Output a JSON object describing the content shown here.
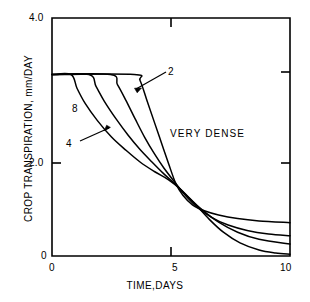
{
  "chart_data": {
    "type": "line",
    "title": "",
    "xlabel": "TIME,DAYS",
    "ylabel": "CROP TRANSPIRATION, mm/DAY",
    "xlim": [
      0,
      10
    ],
    "ylim": [
      0,
      4.0
    ],
    "xticks": [
      0,
      5,
      10
    ],
    "xticklabels": [
      "0",
      "5",
      "10"
    ],
    "yticks": [
      0,
      2.0,
      4.0
    ],
    "yticklabels": [
      "0",
      "2.0",
      "4.0"
    ],
    "grid": false,
    "legend": "none",
    "annotations": [
      {
        "text": "VERY DENSE",
        "x": 5.6,
        "y": 2.35
      },
      {
        "text": "2",
        "x": 5.35,
        "y": 3.22
      },
      {
        "text": "8",
        "x": 0.95,
        "y": 2.68
      },
      {
        "text": "4",
        "x": 0.65,
        "y": 2.05
      }
    ],
    "plateau_value": 3.05,
    "series": [
      {
        "name": "2",
        "label": "2",
        "color": "#000000",
        "points": [
          [
            0.0,
            3.05
          ],
          [
            3.45,
            3.05
          ],
          [
            3.7,
            2.95
          ],
          [
            4.0,
            2.6
          ],
          [
            4.3,
            2.25
          ],
          [
            4.6,
            1.9
          ],
          [
            4.9,
            1.55
          ],
          [
            5.2,
            1.22
          ],
          [
            5.5,
            1.02
          ],
          [
            5.9,
            0.86
          ],
          [
            6.4,
            0.76
          ],
          [
            7.0,
            0.69
          ],
          [
            7.8,
            0.63
          ],
          [
            8.7,
            0.59
          ],
          [
            10.0,
            0.56
          ]
        ]
      },
      {
        "name": "4",
        "label": "4",
        "color": "#000000",
        "points": [
          [
            0.0,
            3.05
          ],
          [
            2.45,
            3.05
          ],
          [
            2.75,
            2.88
          ],
          [
            3.1,
            2.62
          ],
          [
            3.5,
            2.3
          ],
          [
            3.9,
            1.99
          ],
          [
            4.3,
            1.72
          ],
          [
            4.7,
            1.48
          ],
          [
            5.2,
            1.22
          ],
          [
            5.6,
            1.02
          ],
          [
            6.1,
            0.82
          ],
          [
            6.7,
            0.65
          ],
          [
            7.4,
            0.52
          ],
          [
            8.2,
            0.43
          ],
          [
            9.1,
            0.37
          ],
          [
            10.0,
            0.34
          ]
        ]
      },
      {
        "name": "8",
        "label": "8",
        "color": "#000000",
        "points": [
          [
            0.0,
            3.05
          ],
          [
            1.55,
            3.05
          ],
          [
            1.85,
            2.85
          ],
          [
            2.2,
            2.6
          ],
          [
            2.7,
            2.3
          ],
          [
            3.2,
            2.03
          ],
          [
            3.7,
            1.79
          ],
          [
            4.2,
            1.58
          ],
          [
            4.7,
            1.38
          ],
          [
            5.2,
            1.2
          ],
          [
            5.7,
            1.0
          ],
          [
            6.3,
            0.78
          ],
          [
            7.0,
            0.57
          ],
          [
            7.8,
            0.4
          ],
          [
            8.7,
            0.28
          ],
          [
            10.0,
            0.2
          ]
        ]
      },
      {
        "name": "16",
        "label": "",
        "color": "#000000",
        "points": [
          [
            0.0,
            3.05
          ],
          [
            0.8,
            3.05
          ],
          [
            1.05,
            2.82
          ],
          [
            1.4,
            2.56
          ],
          [
            1.9,
            2.28
          ],
          [
            2.5,
            2.0
          ],
          [
            3.1,
            1.78
          ],
          [
            3.7,
            1.58
          ],
          [
            4.3,
            1.42
          ],
          [
            4.9,
            1.28
          ],
          [
            5.4,
            1.12
          ],
          [
            6.0,
            0.88
          ],
          [
            6.6,
            0.62
          ],
          [
            7.2,
            0.4
          ],
          [
            7.9,
            0.22
          ],
          [
            8.7,
            0.1
          ],
          [
            9.4,
            0.05
          ],
          [
            10.0,
            0.03
          ]
        ]
      }
    ]
  },
  "axes": {
    "y_title": "CROP TRANSPIRATION, mm/DAY",
    "x_title": "TIME,DAYS",
    "y_tick_4": "4.0",
    "y_tick_2": "2.0",
    "y_tick_0": "0",
    "x_tick_0": "0",
    "x_tick_5": "5",
    "x_tick_10": "10"
  },
  "labels": {
    "curve_2": "2",
    "curve_8": "8",
    "curve_4": "4",
    "region": "VERY DENSE"
  },
  "colors": {
    "line": "#000000",
    "axis": "#000000",
    "background": "#ffffff"
  }
}
